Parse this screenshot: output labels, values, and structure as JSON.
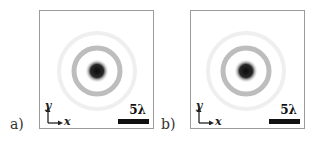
{
  "figure": {
    "panels": [
      {
        "id": "a",
        "label": "a)",
        "scale_bar_label": "5λ",
        "axis_x_label": "x",
        "axis_y_label": "y",
        "pattern": {
          "type": "airy-like ring pattern",
          "core_color": "#111111",
          "ring_color": "#b0b0b0",
          "outer_ring_color": "#ececec"
        }
      },
      {
        "id": "b",
        "label": "b)",
        "scale_bar_label": "5λ",
        "axis_x_label": "x",
        "axis_y_label": "y",
        "pattern": {
          "type": "airy-like ring pattern",
          "core_color": "#111111",
          "ring_color": "#b0b0b0",
          "outer_ring_color": "#ececec"
        }
      }
    ]
  }
}
